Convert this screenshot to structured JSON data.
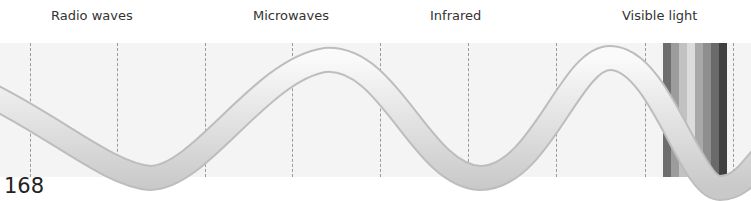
{
  "labels": [
    {
      "text": "Radio waves",
      "x": 51
    },
    {
      "text": "Microwaves",
      "x": 253
    },
    {
      "text": "Infrared",
      "x": 430
    },
    {
      "text": "Visible light",
      "x": 622
    }
  ],
  "page_number": "168",
  "divider_positions": [
    30,
    117,
    205,
    292,
    380,
    468,
    556,
    645,
    733
  ],
  "visible_light_stripes": [
    "#6e6e6e",
    "#9c9c9c",
    "#c2c2c2",
    "#dcdcdc",
    "#a8a8a8",
    "#8e8e8e",
    "#6a6a6a",
    "#404040"
  ],
  "colors": {
    "panel": "#f4f4f4",
    "divider": "#9a9a9a",
    "wave_light": "#f2f2f2",
    "wave_dark": "#b5b5b5"
  }
}
